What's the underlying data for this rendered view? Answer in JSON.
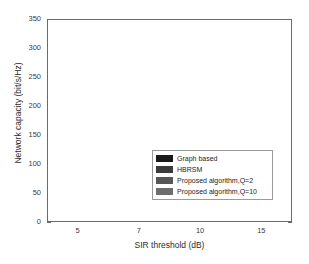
{
  "chart_data": {
    "type": "bar",
    "title": "",
    "xlabel": "SIR threshold (dB)",
    "ylabel": "Network capacity (bit/s/Hz)",
    "categories": [
      "5",
      "7",
      "10",
      "15"
    ],
    "ylim": [
      0,
      350
    ],
    "yticks": [
      0,
      50,
      100,
      150,
      200,
      250,
      300,
      350
    ],
    "ytick_labels": [
      "0",
      "50",
      "100",
      "150",
      "200",
      "250",
      "300",
      "350"
    ],
    "grid": false,
    "legend_position": "center",
    "series": [
      {
        "name": "Graph based",
        "color": "#1a1a1a",
        "values": [
          277,
          272,
          294,
          295
        ]
      },
      {
        "name": "HBRSM",
        "color": "#3b3b3b",
        "values": [
          278,
          284,
          304,
          315
        ]
      },
      {
        "name": "Proposed algorithm,Q=2",
        "color": "#575757",
        "values": [
          282,
          289,
          307,
          316
        ]
      },
      {
        "name": "Proposed algorithm,Q=10",
        "color": "#6d6d6d",
        "values": [
          300,
          310,
          331,
          333
        ]
      }
    ]
  }
}
